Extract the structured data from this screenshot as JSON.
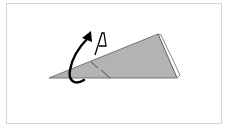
{
  "diagram": {
    "type": "origami-fold-step",
    "label": "A",
    "colors": {
      "border": "#d4d4d4",
      "paper": "#b3b3b3",
      "paper_edge": "#666666",
      "back_flap": "#ffffff",
      "arrow": "#000000",
      "background": "#ffffff"
    },
    "elements": {
      "paper": "gray triangular paper shape",
      "back_flap": "white flap edge behind paper",
      "fold_line": "valley fold line",
      "arrow": "curved fold-behind arrow",
      "label_marker": "A"
    }
  }
}
